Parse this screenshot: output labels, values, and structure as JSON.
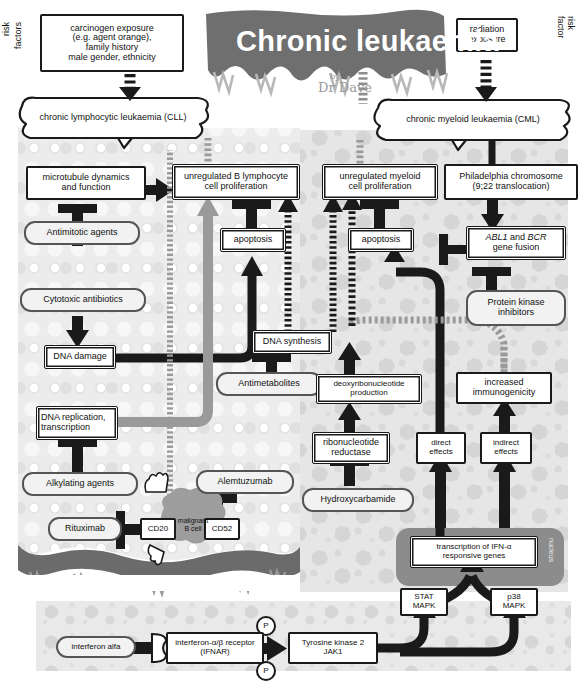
{
  "title": {
    "main": "Chronic leukaemia",
    "byline": "by",
    "author": "Dr Dave"
  },
  "risk_labels": {
    "left": "risk\nfactors",
    "left_line1": "risk",
    "left_line2": "factors",
    "right_line1": "risk",
    "right_line2": "factor"
  },
  "risk_boxes": {
    "left": "carcinogen exposure\n(e.g. agent orange),\nfamily history\nmale gender, ethnicity",
    "left_lines": [
      "carcinogen exposure",
      "(e.g. agent orange),",
      "family history",
      "male gender, ethnicity"
    ],
    "right": "radiation\nexposure",
    "right_lines": [
      "radiation",
      "exposure"
    ]
  },
  "disease": {
    "cll": "chronic lymphocytic leukaemia (CLL)",
    "cml": "chronic myeloid leukaemia (CML)"
  },
  "cll_pathway": {
    "microtubule": [
      "microtubule dynamics",
      "and function"
    ],
    "b_prolif": [
      "unregulated B lymphocyte",
      "cell proliferation"
    ],
    "antimitotic": "Antimitotic agents",
    "apoptosis": "apoptosis",
    "cytotoxic": "Cytotoxic antibiotics",
    "dna_damage": "DNA damage",
    "dna_replication": [
      "DNA replication,",
      "transcription"
    ],
    "alkylating": "Alkylating agents",
    "rituximab": "Rituximab",
    "cd20": "CD20",
    "cd52": "CD52",
    "alemtuzumab": "Alemtuzumab",
    "malignant_cell": [
      "malignant",
      "B cell"
    ]
  },
  "shared_pathway": {
    "dna_synthesis": "DNA synthesis",
    "antimetabolites": "Antimetabolites"
  },
  "cml_pathway": {
    "myeloid_prolif": [
      "unregulated myeloid",
      "cell proliferation"
    ],
    "philadelphia": [
      "Philadelphia chromosome",
      "(9;22 translocation)"
    ],
    "apoptosis": "apoptosis",
    "abl_bcr_italic1": "ABL1",
    "abl_bcr_mid": " and ",
    "abl_bcr_italic2": "BCR",
    "abl_bcr_line2": "gene fusion",
    "protein_kinase": [
      "Protein kinase",
      "inhibitors"
    ],
    "deoxyribo": [
      "deoxyribonucleotide",
      "production"
    ],
    "ribonucleotide": [
      "ribonucleotide",
      "reductase"
    ],
    "hydroxycarbamide": "Hydroxycarbamide",
    "increased_immuno": [
      "increased",
      "immunogenicity"
    ],
    "direct_effects": [
      "direct",
      "effects"
    ],
    "indirect_effects": [
      "indirect",
      "effects"
    ]
  },
  "nucleus": {
    "label": "nucleus",
    "transcription": [
      "transcription of IFN-α",
      "responsive genes"
    ]
  },
  "ifn_signalling": {
    "interferon_alfa": "interferon alfa",
    "receptor": [
      "interferon-α/β receptor",
      "(IFNAR)"
    ],
    "phospho1": "P",
    "phospho2": "P",
    "tyrosine_kinase": [
      "Tyrosine kinase 2",
      "JAK1"
    ],
    "stat_mapk": [
      "STAT",
      "MAPK"
    ],
    "p38_mapk": [
      "p38",
      "MAPK"
    ]
  },
  "colors": {
    "ink": "#1a1a1a",
    "banner": "#6f6f6f",
    "pill_border": "#555555",
    "pill_fill": "#f2f2f2",
    "grey_arrow": "#9a9a9a",
    "cytoplasm_left": "#ebebeb",
    "cytoplasm_right": "#e4e4e4",
    "nucleus": "#8c8c8c",
    "membrane": "#6b6b6b",
    "white": "#ffffff"
  }
}
